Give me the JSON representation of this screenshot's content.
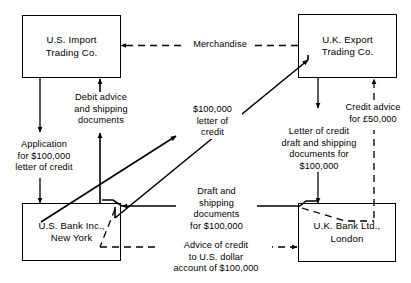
{
  "diagram": {
    "stroke_color": "#000000",
    "background_color": "#ffffff",
    "nodes": [
      {
        "id": "us-import",
        "label": "U.S. Import\nTrading Co."
      },
      {
        "id": "uk-export",
        "label": "U.K. Export\nTrading Co."
      },
      {
        "id": "us-bank",
        "label": "U.S. Bank Inc.,\nNew York"
      },
      {
        "id": "uk-bank",
        "label": "U.K. Bank Ltd.,\nLondon"
      }
    ],
    "edge_labels": [
      {
        "id": "merchandise",
        "text": "Merchandise",
        "style": "dashed"
      },
      {
        "id": "debit-advice",
        "text": "Debit advice\nand shipping\ndocuments",
        "style": "solid"
      },
      {
        "id": "application",
        "text": "Application\nfor $100,000\nletter of credit",
        "style": "solid"
      },
      {
        "id": "letter-of-credit",
        "text": "$100,000\nletter of\ncredit",
        "style": "solid"
      },
      {
        "id": "credit-advice",
        "text": "Credit advice\nfor £50,000",
        "style": "dashed"
      },
      {
        "id": "loc-draft-docs",
        "text": "Letter of credit\ndraft and shipping\ndocuments for\n$100,000",
        "style": "solid"
      },
      {
        "id": "draft-shipping-docs",
        "text": "Draft and\nshipping\ndocuments\nfor $100,000",
        "style": "solid"
      },
      {
        "id": "advice-of-credit",
        "text": "Advice of credit\nto U.S. dollar\naccount of $100,000",
        "style": "dashed"
      }
    ]
  }
}
